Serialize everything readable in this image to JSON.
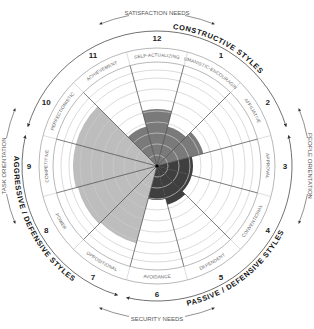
{
  "diagram": {
    "center": [
      157,
      166
    ],
    "outer_radius": 118,
    "band_inner_radius": 104,
    "ring_radii": [
      11,
      22,
      33,
      44,
      55,
      66,
      77,
      88,
      96
    ],
    "colors": {
      "constructive": "#7a7a7a",
      "passive": "#3f3f3f",
      "aggressive": "#bdbdbd",
      "ring": "#cccccc",
      "spoke": "#444444",
      "outline": "#999999"
    },
    "clusters": {
      "constructive": "CONSTRUCTIVE STYLES",
      "passive": "PASSIVE / DEFENSIVE STYLES",
      "aggressive": "AGGRESSIVE / DEFENSIVE STYLES"
    },
    "axes": {
      "top": "SATISFACTION NEEDS",
      "bottom": "SECURITY NEEDS",
      "left": "TASK ORIENTATION",
      "right": "PEOPLE ORIENTATION"
    },
    "styles": [
      {
        "number": "1",
        "label": "HUMANISTIC-ENCOURAGING",
        "cluster": "constructive",
        "extent": 41
      },
      {
        "number": "2",
        "label": "AFFILIATIVE",
        "cluster": "constructive",
        "extent": 48
      },
      {
        "number": "3",
        "label": "APPROVAL",
        "cluster": "passive",
        "extent": 36
      },
      {
        "number": "4",
        "label": "CONVENTIONAL",
        "cluster": "passive",
        "extent": 36
      },
      {
        "number": "5",
        "label": "DEPENDENT",
        "cluster": "passive",
        "extent": 40
      },
      {
        "number": "6",
        "label": "AVOIDANCE",
        "cluster": "passive",
        "extent": 34
      },
      {
        "number": "7",
        "label": "OPPOSITIONAL",
        "cluster": "aggressive",
        "extent": 80
      },
      {
        "number": "8",
        "label": "POWER",
        "cluster": "aggressive",
        "extent": 82
      },
      {
        "number": "9",
        "label": "COMPETITIVE",
        "cluster": "aggressive",
        "extent": 84
      },
      {
        "number": "10",
        "label": "PERFECTIONISTIC",
        "cluster": "aggressive",
        "extent": 84
      },
      {
        "number": "11",
        "label": "ACHIEVEMENT",
        "cluster": "constructive",
        "extent": 41
      },
      {
        "number": "12",
        "label": "SELF-ACTUALIZING",
        "cluster": "constructive",
        "extent": 57
      }
    ]
  }
}
